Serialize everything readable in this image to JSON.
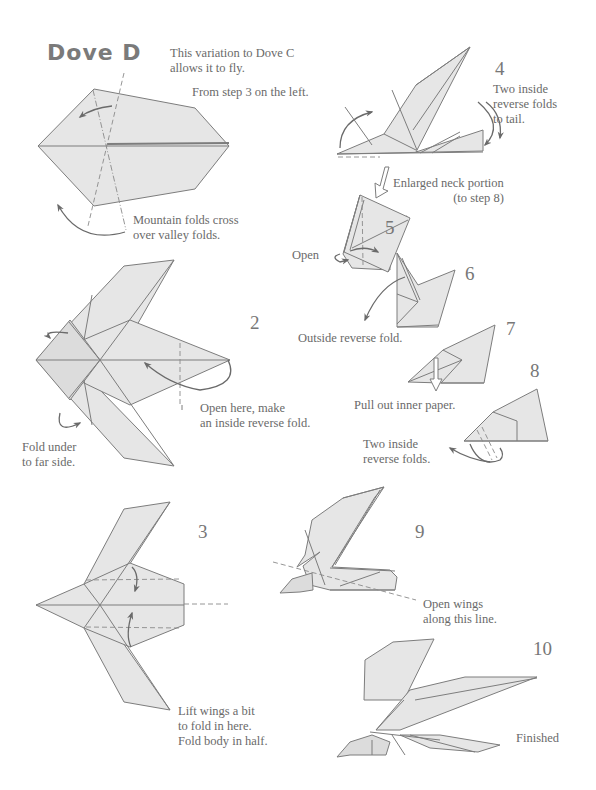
{
  "page": {
    "title": "Dove D",
    "intro": "This variation to Dove C\nallows it to fly.",
    "steps": [
      {
        "number": "",
        "note": "Mountain folds cross\nover valley folds."
      },
      {
        "number": "2",
        "notes": [
          "Open here, make\nan inside reverse fold.",
          "Fold under\nto far side."
        ]
      },
      {
        "number": "3",
        "note": "Lift wings a bit\nto fold in here.\nFold body in half."
      },
      {
        "number": "4",
        "lead": "From step 3 on the left.",
        "note": "Two inside\nreverse folds\nto tail.",
        "enlarge": "Enlarged neck portion\n(to step 8)"
      },
      {
        "number": "5",
        "note": "Open"
      },
      {
        "number": "6",
        "note": "Outside reverse fold."
      },
      {
        "number": "7",
        "note": "Pull out inner paper."
      },
      {
        "number": "8",
        "note": "Two inside\nreverse folds."
      },
      {
        "number": "9",
        "note": "Open wings\nalong this line."
      },
      {
        "number": "10",
        "note": "Finished"
      }
    ]
  },
  "colors": {
    "paper": "#e6e6e6",
    "line": "#7d7d7d",
    "text": "#6a6a6a",
    "title": "#7a7a7a"
  }
}
